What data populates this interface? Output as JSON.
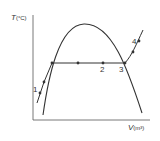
{
  "diagram": {
    "type": "T-v phase diagram",
    "y_axis": {
      "symbol": "T",
      "unit": "(°C)"
    },
    "x_axis": {
      "symbol": "V",
      "unit": "(m³)"
    },
    "state_points": [
      {
        "id": "1",
        "label": "1"
      },
      {
        "id": "2",
        "label": "2"
      },
      {
        "id": "3",
        "label": "3"
      },
      {
        "id": "4",
        "label": "4"
      }
    ],
    "elements": [
      "saturation dome",
      "constant-pressure process line",
      "horizontal phase-change segment"
    ]
  },
  "colors": {
    "line": "#333333",
    "background": "#ffffff"
  }
}
